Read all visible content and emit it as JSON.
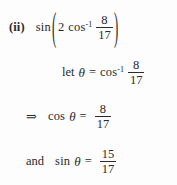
{
  "document": {
    "type": "math-solution-snippet",
    "background_color": "#fdfdfd",
    "text_color": "#2a2a2a"
  },
  "lines": [
    {
      "id": "problem-statement",
      "item_label": "(ii)",
      "function": "sin",
      "open_paren": "(",
      "coefficient": "2",
      "inverse_function": "cos",
      "inverse_exponent": "-1",
      "fraction": {
        "numerator": "8",
        "denominator": "17"
      },
      "close_paren": ")"
    },
    {
      "id": "substitution",
      "keyword": "let",
      "variable": "θ",
      "equals": "=",
      "inverse_function": "cos",
      "inverse_exponent": "-1",
      "fraction": {
        "numerator": "8",
        "denominator": "17"
      }
    },
    {
      "id": "cosine-value",
      "implies": "⇒",
      "function": "cos",
      "variable": "θ",
      "equals": "=",
      "fraction": {
        "numerator": "8",
        "denominator": "17"
      }
    },
    {
      "id": "sine-value",
      "keyword": "and",
      "function": "sin",
      "variable": "θ",
      "equals": "=",
      "fraction": {
        "numerator": "15",
        "denominator": "17"
      }
    }
  ]
}
